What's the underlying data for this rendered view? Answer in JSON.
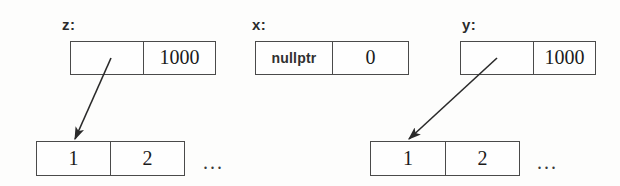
{
  "diagram": {
    "background_color": "#fdfdfc",
    "line_color": "#4a4a4a",
    "text_color": "#1a1a1a"
  },
  "pointer_records": [
    {
      "label": "z:",
      "pointer_cell": "",
      "size_cell": "1000",
      "points_to_array": true
    },
    {
      "label": "x:",
      "pointer_cell": "nullptr",
      "size_cell": "0",
      "points_to_array": false
    },
    {
      "label": "y:",
      "pointer_cell": "",
      "size_cell": "1000",
      "points_to_array": true
    }
  ],
  "arrays": [
    {
      "cells": [
        "1",
        "2"
      ],
      "ellipsis": "..."
    },
    {
      "cells": [
        "1",
        "2"
      ],
      "ellipsis": "..."
    }
  ]
}
